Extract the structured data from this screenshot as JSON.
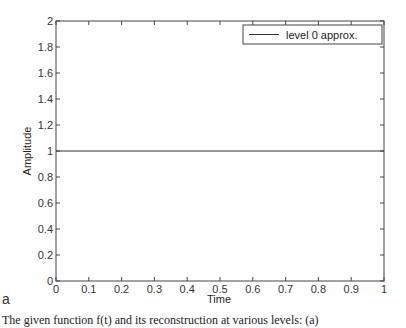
{
  "chart_data": {
    "type": "line",
    "title": "",
    "xlabel": "Time",
    "ylabel": "Amplitude",
    "xlim": [
      0,
      1
    ],
    "ylim": [
      0,
      2
    ],
    "x_ticks": [
      "0",
      "0.1",
      "0.2",
      "0.3",
      "0.4",
      "0.5",
      "0.6",
      "0.7",
      "0.8",
      "0.9",
      "1"
    ],
    "y_ticks": [
      "0",
      "0.2",
      "0.4",
      "0.6",
      "0.8",
      "1",
      "1.2",
      "1.4",
      "1.6",
      "1.8",
      "2"
    ],
    "grid": false,
    "legend_position": "upper right",
    "series": [
      {
        "name": "level 0 approx.",
        "x": [
          0,
          1
        ],
        "values": [
          1,
          1
        ],
        "color": "#333333"
      }
    ]
  },
  "panel_label": "a",
  "caption": "The given function f(t) and its reconstruction at various levels: (a)"
}
